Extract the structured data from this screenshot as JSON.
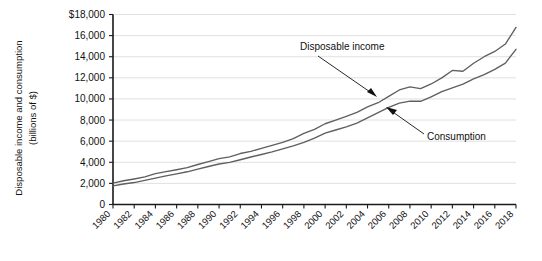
{
  "chart_data": {
    "type": "line",
    "title": "",
    "xlabel": "",
    "ylabel": "Disposable income and consumption (billions of $)",
    "ylabel_line1": "Disposable income and consumption",
    "ylabel_line2": "(billions of $)",
    "ylim": [
      0,
      18000
    ],
    "ytick_values": [
      0,
      2000,
      4000,
      6000,
      8000,
      10000,
      12000,
      14000,
      16000,
      18000
    ],
    "ytick_labels": [
      "0",
      "2,000",
      "4,000",
      "6,000",
      "8,000",
      "10,000",
      "12,000",
      "14,000",
      "16,000",
      "$18,000"
    ],
    "xlim": [
      1980,
      2018
    ],
    "xtick_labels": [
      "1980",
      "1982",
      "1984",
      "1986",
      "1988",
      "1990",
      "1992",
      "1994",
      "1996",
      "1998",
      "2000",
      "2002",
      "2004",
      "2006",
      "2008",
      "2010",
      "2012",
      "2014",
      "2016",
      "2018"
    ],
    "grid": "horizontal",
    "legend": "none",
    "x": [
      1980,
      1981,
      1982,
      1983,
      1984,
      1985,
      1986,
      1987,
      1988,
      1989,
      1990,
      1991,
      1992,
      1993,
      1994,
      1995,
      1996,
      1997,
      1998,
      1999,
      2000,
      2001,
      2002,
      2003,
      2004,
      2005,
      2006,
      2007,
      2008,
      2009,
      2010,
      2011,
      2012,
      2013,
      2014,
      2015,
      2016,
      2017,
      2018
    ],
    "series": [
      {
        "name": "Disposable income",
        "color": "#5f5f5f",
        "values": [
          2020,
          2250,
          2420,
          2610,
          2920,
          3110,
          3290,
          3490,
          3790,
          4060,
          4340,
          4510,
          4830,
          5040,
          5310,
          5600,
          5890,
          6250,
          6740,
          7120,
          7650,
          8000,
          8350,
          8720,
          9240,
          9640,
          10240,
          10850,
          11150,
          10980,
          11420,
          12000,
          12700,
          12620,
          13380,
          14000,
          14500,
          15200,
          16780
        ]
      },
      {
        "name": "Consumption",
        "color": "#5f5f5f",
        "values": [
          1760,
          1940,
          2080,
          2290,
          2500,
          2720,
          2900,
          3100,
          3350,
          3600,
          3840,
          3990,
          4240,
          4500,
          4740,
          4990,
          5270,
          5550,
          5880,
          6280,
          6760,
          7060,
          7350,
          7700,
          8200,
          8700,
          9200,
          9600,
          9800,
          9780,
          10200,
          10700,
          11050,
          11400,
          11900,
          12300,
          12800,
          13400,
          14700
        ]
      }
    ],
    "annotations": [
      {
        "label": "Disposable income",
        "points_to_series": "Disposable income",
        "at_x": 2008
      },
      {
        "label": "Consumption",
        "points_to_series": "Consumption",
        "at_x": 2009
      }
    ]
  },
  "figure": {
    "background_color": "#ffffff",
    "line_color": "#5f5f5f",
    "grid_color": "#d8d8d8",
    "axis_color": "#1a1a1a"
  }
}
